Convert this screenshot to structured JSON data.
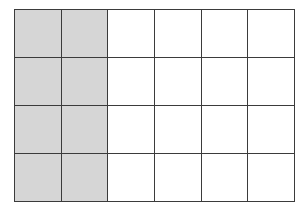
{
  "figure": {
    "kind": "shaded-fraction-grid",
    "columns": 6,
    "rows": 4,
    "total_cells": 24,
    "shaded_cells": 8,
    "unshaded_cells": 16,
    "shaded_fraction": "8/24",
    "shaded_fraction_simplified": "1/3",
    "shaded_percent": "33.3%",
    "shaded_columns": "1-2",
    "colors": {
      "shaded_fill": "#d6d6d6",
      "unshaded_fill": "#ffffff",
      "grid_line": "#3b3b3b",
      "background": "#ffffff"
    },
    "geometry": {
      "left": 14,
      "top": 9,
      "width": 274,
      "height": 188,
      "cell_width": 45.7,
      "cell_height": 47,
      "line_width": 1.6
    }
  },
  "grid": {
    "row_names": [
      "row-1",
      "row-2",
      "row-3",
      "row-4"
    ],
    "column_names": [
      "col-1",
      "col-2",
      "col-3",
      "col-4",
      "col-5",
      "col-6"
    ],
    "cells": [
      [
        {
          "id": "r1c1",
          "state": "shaded"
        },
        {
          "id": "r1c2",
          "state": "shaded"
        },
        {
          "id": "r1c3",
          "state": "unshaded"
        },
        {
          "id": "r1c4",
          "state": "unshaded"
        },
        {
          "id": "r1c5",
          "state": "unshaded"
        },
        {
          "id": "r1c6",
          "state": "unshaded"
        }
      ],
      [
        {
          "id": "r2c1",
          "state": "shaded"
        },
        {
          "id": "r2c2",
          "state": "shaded"
        },
        {
          "id": "r2c3",
          "state": "unshaded"
        },
        {
          "id": "r2c4",
          "state": "unshaded"
        },
        {
          "id": "r2c5",
          "state": "unshaded"
        },
        {
          "id": "r2c6",
          "state": "unshaded"
        }
      ],
      [
        {
          "id": "r3c1",
          "state": "shaded"
        },
        {
          "id": "r3c2",
          "state": "shaded"
        },
        {
          "id": "r3c3",
          "state": "unshaded"
        },
        {
          "id": "r3c4",
          "state": "unshaded"
        },
        {
          "id": "r3c5",
          "state": "unshaded"
        },
        {
          "id": "r3c6",
          "state": "unshaded"
        }
      ],
      [
        {
          "id": "r4c1",
          "state": "shaded"
        },
        {
          "id": "r4c2",
          "state": "shaded"
        },
        {
          "id": "r4c3",
          "state": "unshaded"
        },
        {
          "id": "r4c4",
          "state": "unshaded"
        },
        {
          "id": "r4c5",
          "state": "unshaded"
        },
        {
          "id": "r4c6",
          "state": "unshaded"
        }
      ]
    ]
  }
}
